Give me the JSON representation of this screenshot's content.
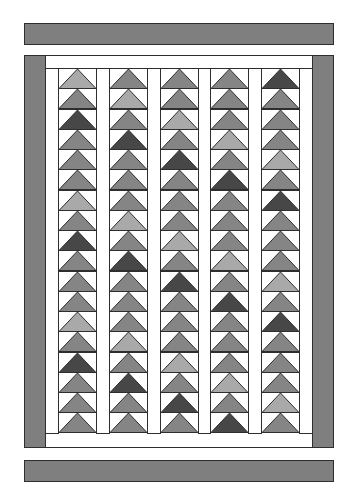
{
  "colors": {
    "border": "#7f7f7f",
    "outline": "#2e2e2e",
    "background": "#ffffff",
    "light": "#a9a9a9",
    "medium": "#858585",
    "dark": "#474747"
  },
  "layout": {
    "rows_per_column": 18,
    "columns": 5
  },
  "columns": [
    {
      "name": "column-1",
      "shades": [
        "L",
        "M",
        "D",
        "M",
        "M",
        "M",
        "L",
        "M",
        "D",
        "M",
        "M",
        "M",
        "L",
        "M",
        "D",
        "M",
        "M",
        "M"
      ]
    },
    {
      "name": "column-2",
      "shades": [
        "M",
        "L",
        "M",
        "D",
        "M",
        "M",
        "M",
        "L",
        "M",
        "D",
        "M",
        "M",
        "M",
        "L",
        "M",
        "D",
        "M",
        "M"
      ]
    },
    {
      "name": "column-3",
      "shades": [
        "M",
        "M",
        "L",
        "M",
        "D",
        "M",
        "M",
        "M",
        "L",
        "M",
        "D",
        "M",
        "M",
        "M",
        "L",
        "M",
        "D",
        "M"
      ]
    },
    {
      "name": "column-4",
      "shades": [
        "M",
        "M",
        "M",
        "L",
        "M",
        "D",
        "M",
        "M",
        "M",
        "L",
        "M",
        "D",
        "M",
        "M",
        "M",
        "L",
        "M",
        "D"
      ]
    },
    {
      "name": "column-5",
      "shades": [
        "D",
        "M",
        "M",
        "M",
        "L",
        "M",
        "D",
        "M",
        "M",
        "M",
        "L",
        "M",
        "D",
        "M",
        "M",
        "M",
        "L",
        "M"
      ]
    }
  ]
}
